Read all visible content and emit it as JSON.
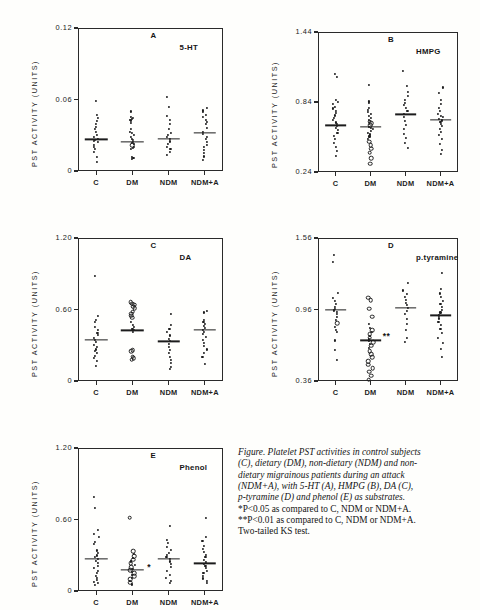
{
  "figure": {
    "axis_title": "PST  ACTIVITY (UNITS)",
    "group_labels": [
      "C",
      "DM",
      "NDM",
      "NDM+A"
    ]
  },
  "caption": {
    "lines_italic": [
      "Figure. Platelet PST activities in control subjects",
      "(C), dietary (DM), non-dietary (NDM) and non-",
      "dietary migrainous patients during an attack",
      "(NDM+A), with 5-HT (A), HMPG (B), DA (C),",
      "p-tyramine (D) and phenol (E) as substrates."
    ],
    "lines_roman": [
      "*P<0.05 as compared to C, NDM or NDM+A.",
      "**P<0.01 as compared to C, NDM or NDM+A.",
      "Two-tailed KS test."
    ]
  },
  "chart_data": [
    {
      "id": "A",
      "type": "scatter",
      "panel_letter": "A",
      "title": "5-HT",
      "ylabel": "PST  ACTIVITY (UNITS)",
      "ylim": [
        0,
        0.12
      ],
      "yticks": [
        0,
        0.06,
        0.12
      ],
      "ytick_labels": [
        "0",
        "0.06",
        "0.12"
      ],
      "categories": [
        "C",
        "DM",
        "NDM",
        "NDM+A"
      ],
      "means": [
        0.0265,
        0.0243,
        0.0268,
        0.0318
      ],
      "significance": [],
      "series": [
        {
          "name": "C",
          "values": [
            0.0585,
            0.0472,
            0.0448,
            0.042,
            0.0396,
            0.0372,
            0.035,
            0.033,
            0.0305,
            0.0288,
            0.0272,
            0.0262,
            0.0252,
            0.024,
            0.0222,
            0.0205,
            0.0185,
            0.016,
            0.012,
            0.0075
          ],
          "open": []
        },
        {
          "name": "DM",
          "values": [
            0.05,
            0.0455,
            0.0448,
            0.044,
            0.0432,
            0.0424,
            0.04,
            0.0352,
            0.033,
            0.0318,
            0.03,
            0.0288,
            0.0272,
            0.0258,
            0.0246,
            0.0238,
            0.0228,
            0.0216,
            0.0205,
            0.0195,
            0.0186,
            0.012,
            0.0112,
            0.0104
          ],
          "open": [
            0.0216
          ]
        },
        {
          "name": "NDM",
          "values": [
            0.0625,
            0.054,
            0.0462,
            0.043,
            0.0392,
            0.035,
            0.032,
            0.03,
            0.0282,
            0.0268,
            0.0248,
            0.0225,
            0.0205,
            0.0182,
            0.0158,
            0.0132
          ],
          "open": []
        },
        {
          "name": "NDM+A",
          "values": [
            0.053,
            0.0508,
            0.0492,
            0.047,
            0.045,
            0.0432,
            0.041,
            0.0392,
            0.036,
            0.033,
            0.0308,
            0.0288,
            0.0266,
            0.0244,
            0.0222,
            0.02,
            0.0176,
            0.015,
            0.0122,
            0.0092
          ],
          "open": []
        }
      ]
    },
    {
      "id": "B",
      "type": "scatter",
      "panel_letter": "B",
      "title": "HMPG",
      "ylabel": "PST  ACTIVITY (UNITS)",
      "ylim": [
        0.24,
        1.44
      ],
      "yticks": [
        0.24,
        0.84,
        1.44
      ],
      "ytick_labels": [
        "0.24",
        "0.84",
        "1.44"
      ],
      "categories": [
        "C",
        "DM",
        "NDM",
        "NDM+A"
      ],
      "means": [
        0.64,
        0.628,
        0.735,
        0.69
      ],
      "significance": [],
      "series": [
        {
          "name": "C",
          "values": [
            1.08,
            1.055,
            0.86,
            0.84,
            0.82,
            0.8,
            0.785,
            0.765,
            0.745,
            0.725,
            0.705,
            0.685,
            0.665,
            0.65,
            0.636,
            0.62,
            0.6,
            0.575,
            0.55,
            0.52,
            0.49,
            0.455,
            0.42,
            0.38
          ],
          "open": []
        },
        {
          "name": "DM",
          "values": [
            0.99,
            0.845,
            0.828,
            0.79,
            0.772,
            0.752,
            0.735,
            0.718,
            0.7,
            0.685,
            0.67,
            0.656,
            0.642,
            0.63,
            0.618,
            0.606,
            0.592,
            0.578,
            0.562,
            0.545,
            0.525,
            0.5,
            0.47,
            0.44,
            0.405,
            0.36,
            0.31
          ],
          "open": [
            0.67,
            0.656,
            0.642,
            0.5,
            0.47,
            0.44,
            0.405,
            0.36,
            0.31
          ]
        },
        {
          "name": "NDM",
          "values": [
            1.11,
            0.975,
            0.93,
            0.888,
            0.858,
            0.835,
            0.812,
            0.79,
            0.765,
            0.74,
            0.712,
            0.68,
            0.645,
            0.608,
            0.57,
            0.53,
            0.49,
            0.45
          ],
          "open": []
        },
        {
          "name": "NDM+A",
          "values": [
            0.965,
            0.92,
            0.86,
            0.82,
            0.79,
            0.762,
            0.74,
            0.722,
            0.708,
            0.694,
            0.682,
            0.668,
            0.652,
            0.632,
            0.61,
            0.585,
            0.556,
            0.52,
            0.478,
            0.43,
            0.395
          ],
          "open": []
        }
      ]
    },
    {
      "id": "C",
      "type": "scatter",
      "panel_letter": "C",
      "title": "DA",
      "ylabel": "PST  ACTIVITY (UNITS)",
      "ylim": [
        0,
        1.2
      ],
      "yticks": [
        0,
        0.6,
        1.2
      ],
      "ytick_labels": [
        "0",
        "0.60",
        "1.20"
      ],
      "categories": [
        "C",
        "DM",
        "NDM",
        "NDM+A"
      ],
      "means": [
        0.345,
        0.425,
        0.332,
        0.432
      ],
      "significance": [],
      "series": [
        {
          "name": "C",
          "values": [
            0.88,
            0.545,
            0.512,
            0.492,
            0.455,
            0.43,
            0.405,
            0.385,
            0.36,
            0.345,
            0.33,
            0.3,
            0.282,
            0.265,
            0.25,
            0.232,
            0.212,
            0.19,
            0.165,
            0.128
          ],
          "open": []
        },
        {
          "name": "DM",
          "values": [
            0.66,
            0.648,
            0.64,
            0.625,
            0.612,
            0.58,
            0.565,
            0.548,
            0.532,
            0.495,
            0.472,
            0.452,
            0.44,
            0.428,
            0.415,
            0.258,
            0.248,
            0.205,
            0.192,
            0.18
          ],
          "open": [
            0.66,
            0.648,
            0.64,
            0.625,
            0.612,
            0.58,
            0.565,
            0.548,
            0.532,
            0.258,
            0.248,
            0.205,
            0.192,
            0.18
          ]
        },
        {
          "name": "NDM",
          "values": [
            0.565,
            0.47,
            0.44,
            0.408,
            0.382,
            0.355,
            0.335,
            0.312,
            0.288,
            0.262,
            0.235,
            0.205,
            0.175,
            0.148,
            0.118,
            0.102
          ],
          "open": []
        },
        {
          "name": "NDM+A",
          "values": [
            0.585,
            0.575,
            0.512,
            0.492,
            0.478,
            0.462,
            0.448,
            0.432,
            0.415,
            0.392,
            0.368,
            0.342,
            0.318,
            0.292,
            0.265,
            0.238,
            0.205,
            0.145
          ],
          "open": []
        }
      ]
    },
    {
      "id": "D",
      "type": "scatter",
      "panel_letter": "D",
      "title": "p.tyramine",
      "ylabel": "PST  ACTIVITY (UNITS)",
      "ylim": [
        0.36,
        1.56
      ],
      "yticks": [
        0.36,
        0.96,
        1.56
      ],
      "ytick_labels": [
        "0.36",
        "0.96",
        "1.56"
      ],
      "categories": [
        "C",
        "DM",
        "NDM",
        "NDM+A"
      ],
      "means": [
        0.96,
        0.7,
        0.975,
        0.91
      ],
      "significance": [
        {
          "group": "DM",
          "marker": "**",
          "value": 0.735
        }
      ],
      "series": [
        {
          "name": "C",
          "values": [
            1.42,
            1.36,
            1.1,
            1.06,
            1.03,
            1.005,
            0.985,
            0.968,
            0.952,
            0.938,
            0.92,
            0.9,
            0.875,
            0.845,
            0.812,
            0.792,
            0.775,
            0.7,
            0.62,
            0.54
          ],
          "open": [
            0.845
          ]
        },
        {
          "name": "DM",
          "values": [
            1.06,
            1.04,
            0.965,
            0.9,
            0.84,
            0.805,
            0.785,
            0.768,
            0.752,
            0.738,
            0.725,
            0.712,
            0.7,
            0.688,
            0.672,
            0.655,
            0.635,
            0.612,
            0.585,
            0.558,
            0.528,
            0.498,
            0.468,
            0.438,
            0.405,
            0.372
          ],
          "open": [
            1.06,
            1.04,
            0.965,
            0.9,
            0.785,
            0.752,
            0.725,
            0.688,
            0.655,
            0.612,
            0.585,
            0.558,
            0.528,
            0.498,
            0.468,
            0.438,
            0.405,
            0.372
          ]
        },
        {
          "name": "NDM",
          "values": [
            1.185,
            1.12,
            1.09,
            1.062,
            1.038,
            1.015,
            0.995,
            0.975,
            0.95,
            0.92,
            0.88,
            0.835,
            0.79,
            0.725,
            0.69
          ],
          "open": []
        },
        {
          "name": "NDM+A",
          "values": [
            1.27,
            1.13,
            1.095,
            1.062,
            1.032,
            1.005,
            0.982,
            0.96,
            0.935,
            0.91,
            0.885,
            0.858,
            0.828,
            0.795,
            0.76,
            0.722,
            0.68,
            0.63,
            0.565
          ],
          "open": []
        }
      ]
    },
    {
      "id": "E",
      "type": "scatter",
      "panel_letter": "E",
      "title": "Phenol",
      "ylabel": "PST  ACTIVITY (UNITS)",
      "ylim": [
        0,
        1.2
      ],
      "yticks": [
        0,
        0.6,
        1.2
      ],
      "ytick_labels": [
        "0",
        "0.60",
        "1.20"
      ],
      "categories": [
        "C",
        "DM",
        "NDM",
        "NDM+A"
      ],
      "means": [
        0.272,
        0.175,
        0.272,
        0.232
      ],
      "significance": [
        {
          "group": "DM",
          "marker": "*",
          "value": 0.198
        }
      ],
      "series": [
        {
          "name": "C",
          "values": [
            0.79,
            0.7,
            0.51,
            0.478,
            0.452,
            0.412,
            0.392,
            0.34,
            0.318,
            0.298,
            0.282,
            0.268,
            0.252,
            0.232,
            0.212,
            0.192,
            0.172,
            0.15,
            0.128,
            0.108,
            0.092,
            0.078,
            0.065,
            0.052
          ],
          "open": []
        },
        {
          "name": "DM",
          "values": [
            0.615,
            0.335,
            0.312,
            0.292,
            0.275,
            0.262,
            0.248,
            0.232,
            0.215,
            0.2,
            0.188,
            0.175,
            0.162,
            0.15,
            0.138,
            0.125,
            0.112,
            0.098,
            0.082,
            0.068,
            0.055
          ],
          "open": [
            0.615,
            0.335,
            0.292,
            0.262,
            0.232,
            0.2,
            0.175,
            0.15,
            0.125,
            0.098,
            0.068
          ]
        },
        {
          "name": "NDM",
          "values": [
            0.545,
            0.432,
            0.4,
            0.372,
            0.345,
            0.322,
            0.302,
            0.285,
            0.268,
            0.248,
            0.225,
            0.198,
            0.165,
            0.135,
            0.108,
            0.088,
            0.07
          ],
          "open": []
        },
        {
          "name": "NDM+A",
          "values": [
            0.612,
            0.452,
            0.42,
            0.378,
            0.352,
            0.325,
            0.302,
            0.282,
            0.262,
            0.245,
            0.228,
            0.21,
            0.192,
            0.172,
            0.15,
            0.128,
            0.105,
            0.085,
            0.068
          ],
          "open": []
        }
      ]
    }
  ]
}
